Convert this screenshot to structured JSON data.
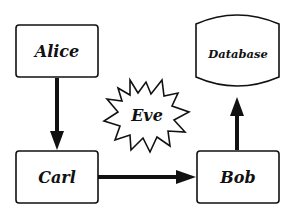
{
  "diagram": {
    "nodes": [
      {
        "id": "alice",
        "label": "Alice",
        "shape": "rounded-rect"
      },
      {
        "id": "carl",
        "label": "Carl",
        "shape": "rounded-rect"
      },
      {
        "id": "bob",
        "label": "Bob",
        "shape": "rounded-rect"
      },
      {
        "id": "database",
        "label": "Database",
        "shape": "cylinder"
      },
      {
        "id": "eve",
        "label": "Eve",
        "shape": "starburst"
      }
    ],
    "edges": [
      {
        "from": "alice",
        "to": "carl"
      },
      {
        "from": "carl",
        "to": "bob"
      },
      {
        "from": "bob",
        "to": "database"
      }
    ],
    "colors": {
      "stroke": "#111111",
      "fill": "#ffffff"
    }
  }
}
